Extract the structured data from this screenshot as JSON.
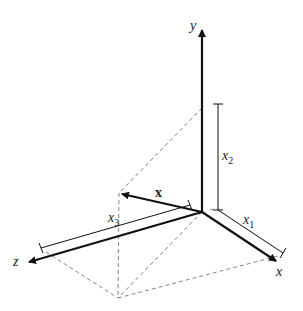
{
  "diagram": {
    "type": "3d-coordinate-system",
    "colors": {
      "stroke": "#111111",
      "dashed": "#777777",
      "background": "#ffffff"
    },
    "axes": {
      "y": {
        "label": "y"
      },
      "x": {
        "label": "x"
      },
      "z": {
        "label": "z"
      }
    },
    "vector": {
      "label": "x"
    },
    "components": {
      "x1": {
        "base": "x",
        "sub": "1"
      },
      "x2": {
        "base": "x",
        "sub": "2"
      },
      "x3": {
        "base": "x",
        "sub": "3"
      }
    }
  }
}
